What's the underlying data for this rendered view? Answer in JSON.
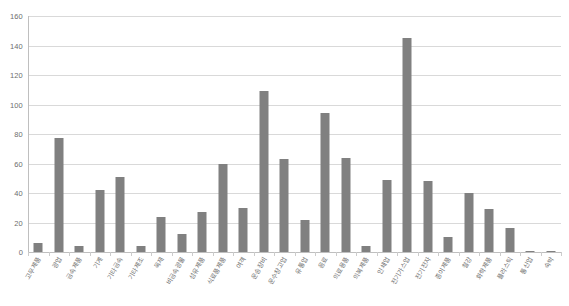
{
  "chart_data": {
    "type": "bar",
    "title": "",
    "subtitle": "",
    "xlabel": "",
    "ylabel": "",
    "ylim": [
      0,
      160
    ],
    "ytick_values": [
      0,
      20,
      40,
      60,
      80,
      100,
      120,
      140,
      160
    ],
    "ytick_labels": [
      "0",
      "20",
      "40",
      "60",
      "80",
      "100",
      "120",
      "140",
      "160"
    ],
    "grid": true,
    "legend": "none",
    "bar_color": "#808080",
    "gridline_color": "#d9d9d9",
    "axis_color": "#bfbfbf",
    "categories": [
      "고무제품",
      "광업",
      "금속제품",
      "기계",
      "기타금속",
      "기타제조",
      "목재",
      "비금속광물",
      "섬유제품",
      "식료품제품",
      "여객",
      "운송장비",
      "운수창고업",
      "유통업",
      "음료",
      "의료용품",
      "의복제품",
      "인쇄업",
      "전기가스업",
      "전기전자",
      "종이제품",
      "철강",
      "화학제품",
      "플라스틱",
      "통신업",
      "숙박"
    ],
    "values": [
      6,
      77,
      4,
      42,
      51,
      4,
      24,
      12,
      27,
      60,
      30,
      109,
      63,
      22,
      94,
      64,
      4,
      49,
      145,
      48,
      10,
      40,
      29,
      16,
      1,
      1
    ]
  }
}
